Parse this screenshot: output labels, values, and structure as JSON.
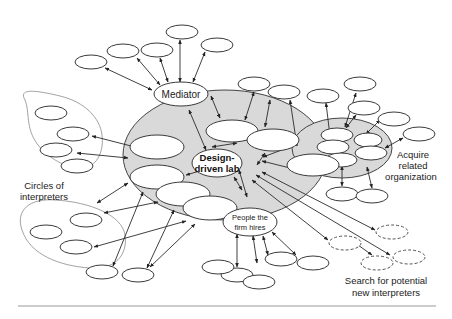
{
  "diagram": {
    "center_label_line1": "Design-",
    "center_label_line2": "driven lab",
    "mediator_label": "Mediator",
    "hires_label_line1": "People the",
    "hires_label_line2": "firm hires",
    "circles_label_line1": "Circles of",
    "circles_label_line2": "interpreters",
    "acquire_label_line1": "Acquire",
    "acquire_label_line2": "related",
    "acquire_label_line3": "organization",
    "search_label_line1": "Search for potential",
    "search_label_line2": "new interpreters"
  },
  "colors": {
    "hub_fill": "#d9d9d9",
    "stroke": "#3a3a3a",
    "group_outline": "#8a8a8a",
    "background": "#ffffff"
  }
}
